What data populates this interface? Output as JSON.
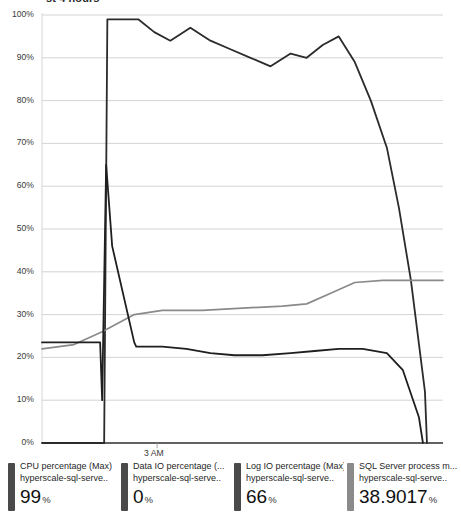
{
  "widget": {
    "title": "st 4 hours",
    "x_axis_tick": "3 AM"
  },
  "axis": {
    "y_ticks": [
      "100%",
      "90%",
      "80%",
      "70%",
      "60%",
      "50%",
      "40%",
      "30%",
      "20%",
      "10%",
      "0%"
    ]
  },
  "legend": {
    "items": [
      {
        "metric": "CPU percentage (Max)",
        "resource": "hyperscale-sql-serve..",
        "value": "99",
        "unit": "%",
        "color": "#4a4a4a"
      },
      {
        "metric": "Data IO percentage (...",
        "resource": "hyperscale-sql-serve..",
        "value": "0",
        "unit": "%",
        "color": "#4a4a4a"
      },
      {
        "metric": "Log IO percentage (Max)",
        "resource": "hyperscale-sql-serve..",
        "value": "66",
        "unit": "%",
        "color": "#4a4a4a"
      },
      {
        "metric": "SQL Server process m...",
        "resource": "hyperscale-sql-serve..",
        "value": "38.9017",
        "unit": "%",
        "color": "#8a8a8a"
      }
    ]
  },
  "chart_data": {
    "type": "line",
    "title": "st 4 hours",
    "xlabel": "",
    "ylabel": "",
    "ylim": [
      0,
      100
    ],
    "grid": true,
    "legend_position": "bottom",
    "x_tick_labels": [
      "3 AM"
    ],
    "series": [
      {
        "name": "CPU percentage (Max)",
        "color": "#2b2b2b",
        "current_value": 99,
        "x": [
          0.0,
          15.5,
          16.3,
          18.0,
          24.0,
          28.0,
          32.0,
          37.0,
          42.0,
          47.0,
          52.0,
          57.0,
          62.0,
          66.0,
          70.0,
          74.0,
          78.0,
          82.0,
          86.0,
          89.0,
          92.0,
          95.5,
          96.0
        ],
        "values": [
          0,
          0,
          99,
          99,
          99,
          96,
          94,
          97,
          94,
          92,
          90,
          88,
          91,
          90,
          93,
          95,
          89,
          80,
          69,
          55,
          38,
          12,
          0
        ]
      },
      {
        "name": "Data IO percentage (...",
        "color": "#9b9b9b",
        "current_value": 0,
        "x": [
          0.0,
          100.0
        ],
        "values": [
          0,
          0
        ]
      },
      {
        "name": "Log IO percentage (Max)",
        "color": "#8a8a8a",
        "current_value": 66,
        "x": [
          0.0,
          8.0,
          15.0,
          23.0,
          30.0,
          40.0,
          50.0,
          60.0,
          66.0,
          72.0,
          78.0,
          85.0,
          92.0,
          100.0
        ],
        "values": [
          22,
          23,
          26,
          30,
          31,
          31,
          31.5,
          32,
          32.5,
          35,
          37.5,
          38,
          38,
          38
        ]
      },
      {
        "name": "SQL Server process m...",
        "color": "#1f1f1f",
        "current_value": 38.9017,
        "x": [
          0.0,
          14.5,
          15.0,
          16.0,
          17.5,
          23.0,
          23.5,
          30.0,
          36.0,
          42.0,
          48.0,
          55.0,
          62.0,
          68.0,
          74.0,
          80.0,
          86.0,
          90.0,
          94.0,
          95.0
        ],
        "values": [
          23.5,
          23.5,
          10,
          65,
          46,
          23.5,
          22.5,
          22.5,
          22,
          21,
          20.5,
          20.5,
          21,
          21.5,
          22,
          22,
          21,
          17,
          6,
          0
        ]
      }
    ]
  }
}
